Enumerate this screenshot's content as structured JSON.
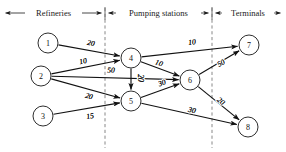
{
  "figure": {
    "type": "network-flow-diagram",
    "title": "",
    "zones": [
      {
        "id": "refineries",
        "label": "Refineries",
        "x_range": [
          2,
          105
        ]
      },
      {
        "id": "pumping_stations",
        "label": "Pumping stations",
        "x_range": [
          105,
          212
        ]
      },
      {
        "id": "terminals",
        "label": "Terminals",
        "x_range": [
          212,
          284
        ]
      }
    ],
    "dividers": [
      105,
      212
    ],
    "nodes": [
      {
        "id": "1",
        "label": "1",
        "x": 48,
        "y": 43,
        "r": 10,
        "zone": "refineries"
      },
      {
        "id": "2",
        "label": "2",
        "x": 41,
        "y": 76,
        "r": 10,
        "zone": "refineries"
      },
      {
        "id": "3",
        "label": "3",
        "x": 43,
        "y": 116,
        "r": 10,
        "zone": "refineries"
      },
      {
        "id": "4",
        "label": "4",
        "x": 131,
        "y": 58,
        "r": 10,
        "zone": "pumping_stations"
      },
      {
        "id": "5",
        "label": "5",
        "x": 131,
        "y": 101,
        "r": 10,
        "zone": "pumping_stations"
      },
      {
        "id": "6",
        "label": "6",
        "x": 190,
        "y": 80,
        "r": 10,
        "zone": "pumping_stations"
      },
      {
        "id": "7",
        "label": "7",
        "x": 249,
        "y": 45,
        "r": 10,
        "zone": "terminals"
      },
      {
        "id": "8",
        "label": "8",
        "x": 248,
        "y": 127,
        "r": 10,
        "zone": "terminals"
      }
    ],
    "edges": [
      {
        "id": "e-1-4",
        "from": "1",
        "to": "4",
        "label": "20",
        "lx": 91,
        "ly": 43
      },
      {
        "id": "e-2-4",
        "from": "2",
        "to": "4",
        "label": "10",
        "lx": 83,
        "ly": 61
      },
      {
        "id": "e-2-6",
        "from": "2",
        "to": "6",
        "label": "50",
        "lx": 111,
        "ly": 70
      },
      {
        "id": "e-2-5",
        "from": "2",
        "to": "5",
        "label": "20",
        "lx": 89,
        "ly": 96
      },
      {
        "id": "e-3-5",
        "from": "3",
        "to": "5",
        "label": "15",
        "lx": 90,
        "ly": 116
      },
      {
        "id": "e-4-5",
        "from": "4",
        "to": "5",
        "label": "20",
        "lx": 140,
        "ly": 78
      },
      {
        "id": "e-4-7",
        "from": "4",
        "to": "7",
        "label": "10",
        "lx": 192,
        "ly": 42
      },
      {
        "id": "e-4-6",
        "from": "4",
        "to": "6",
        "label": "10",
        "lx": 159,
        "ly": 63
      },
      {
        "id": "e-5-6",
        "from": "5",
        "to": "6",
        "label": "30",
        "lx": 162,
        "ly": 83
      },
      {
        "id": "e-5-8",
        "from": "5",
        "to": "8",
        "label": "30",
        "lx": 192,
        "ly": 110
      },
      {
        "id": "e-6-7",
        "from": "6",
        "to": "7",
        "label": "50",
        "lx": 221,
        "ly": 63
      },
      {
        "id": "e-6-8",
        "from": "6",
        "to": "8",
        "label": "20",
        "lx": 221,
        "ly": 101
      }
    ]
  }
}
